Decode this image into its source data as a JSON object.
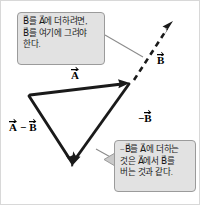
{
  "figure": {
    "background_color": "#ffffff",
    "frame_color": "#d8d8d8",
    "vector_color": "#000000",
    "callout_fill": "#e2e2e2",
    "callout_border": "#9b9b9b",
    "pointer_color": "#8c8c8c"
  },
  "callouts": {
    "add": {
      "lines": [
        "B⃗를 A⃗에 더하려면,",
        "B⃗를 여기에 그려야",
        "한다."
      ]
    },
    "subtract": {
      "lines": [
        "−B⃗를 A⃗에 더하는",
        "것은 A⃗에서 B⃗를",
        "버는 것과 같다."
      ]
    }
  },
  "labels": {
    "A": "A",
    "B": "B",
    "negB_minus": "−",
    "negB": "B",
    "AminusB_first": "A",
    "AminusB_op": "−",
    "AminusB_second": "B"
  },
  "geometry": {
    "vertex_left": [
      28,
      94
    ],
    "vertex_right": [
      128,
      82
    ],
    "vertex_bottom": [
      71,
      166
    ],
    "dashed_tip": [
      172,
      21
    ],
    "vector_A_label": "A",
    "vector_B_label": "B",
    "vector_negB_label": "-B",
    "vector_AminusB_label": "A-B"
  }
}
